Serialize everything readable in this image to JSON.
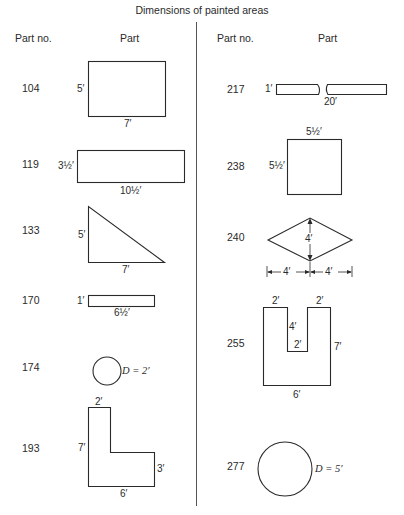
{
  "title": "Dimensions of painted areas",
  "headers": {
    "left": {
      "part_no": "Part no.",
      "part": "Part"
    },
    "right": {
      "part_no": "Part no.",
      "part": "Part"
    }
  },
  "parts": {
    "p104": {
      "part_no": "104",
      "shape": "rectangle",
      "labels": {
        "height": "5′",
        "width": "7′"
      }
    },
    "p119": {
      "part_no": "119",
      "shape": "rectangle",
      "labels": {
        "height": "3½′",
        "width": "10½′"
      }
    },
    "p133": {
      "part_no": "133",
      "shape": "right-triangle",
      "labels": {
        "height": "5′",
        "base": "7′"
      }
    },
    "p170": {
      "part_no": "170",
      "shape": "rectangle",
      "labels": {
        "height": "1′",
        "width": "6½′"
      }
    },
    "p174": {
      "part_no": "174",
      "shape": "circle",
      "labels": {
        "diameter": "D = 2′"
      }
    },
    "p193": {
      "part_no": "193",
      "shape": "L-shape",
      "labels": {
        "top": "2′",
        "left": "7′",
        "right": "3′",
        "bottom": "6′"
      }
    },
    "p217": {
      "part_no": "217",
      "shape": "long-strip",
      "labels": {
        "height": "1′",
        "length": "20′"
      }
    },
    "p238": {
      "part_no": "238",
      "shape": "square",
      "labels": {
        "top": "5½′",
        "left": "5½′"
      }
    },
    "p240": {
      "part_no": "240",
      "shape": "rhombus",
      "labels": {
        "vertical": "4′",
        "left_half": "4′",
        "right_half": "4′"
      }
    },
    "p255": {
      "part_no": "255",
      "shape": "U-shape",
      "labels": {
        "top_left": "2′",
        "top_right": "2′",
        "notch_depth": "4′",
        "notch_width": "2′",
        "right": "7′",
        "bottom": "6′"
      }
    },
    "p277": {
      "part_no": "277",
      "shape": "circle",
      "labels": {
        "diameter": "D = 5′"
      }
    }
  }
}
